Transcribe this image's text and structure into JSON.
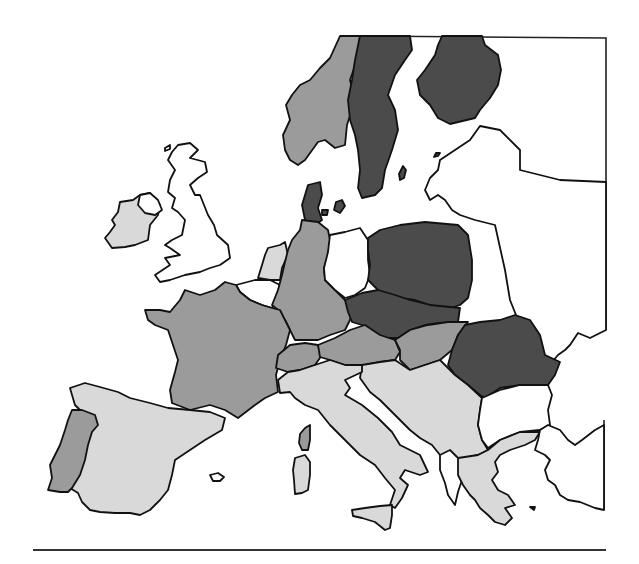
{
  "map": {
    "region": "Europe",
    "type": "choropleth",
    "shade_classes": {
      "none": "#ffffff",
      "light": "#d9d9d9",
      "medium": "#9b9b9b",
      "dark": "#4b4b4b"
    },
    "outline_color": "#111111",
    "countries": [
      {
        "name": "Ireland",
        "shade": "light"
      },
      {
        "name": "United Kingdom",
        "shade": "none"
      },
      {
        "name": "Norway",
        "shade": "medium"
      },
      {
        "name": "Sweden",
        "shade": "dark"
      },
      {
        "name": "Finland",
        "shade": "dark"
      },
      {
        "name": "Denmark",
        "shade": "dark"
      },
      {
        "name": "Netherlands",
        "shade": "light"
      },
      {
        "name": "Belgium",
        "shade": "none"
      },
      {
        "name": "Germany",
        "shade": "medium"
      },
      {
        "name": "East Germany",
        "shade": "none"
      },
      {
        "name": "Poland",
        "shade": "dark"
      },
      {
        "name": "Czechoslovakia",
        "shade": "dark"
      },
      {
        "name": "France",
        "shade": "medium"
      },
      {
        "name": "Switzerland",
        "shade": "medium"
      },
      {
        "name": "Austria",
        "shade": "medium"
      },
      {
        "name": "Hungary",
        "shade": "medium"
      },
      {
        "name": "Romania",
        "shade": "dark"
      },
      {
        "name": "Spain",
        "shade": "light"
      },
      {
        "name": "Portugal",
        "shade": "medium"
      },
      {
        "name": "Italy",
        "shade": "light"
      },
      {
        "name": "Sicily",
        "shade": "light"
      },
      {
        "name": "Sardinia",
        "shade": "light"
      },
      {
        "name": "Corsica",
        "shade": "medium"
      },
      {
        "name": "Yugoslavia",
        "shade": "light"
      },
      {
        "name": "Albania",
        "shade": "none"
      },
      {
        "name": "Bulgaria",
        "shade": "none"
      },
      {
        "name": "Greece",
        "shade": "light"
      },
      {
        "name": "Turkey",
        "shade": "none"
      },
      {
        "name": "USSR",
        "shade": "none"
      }
    ]
  }
}
